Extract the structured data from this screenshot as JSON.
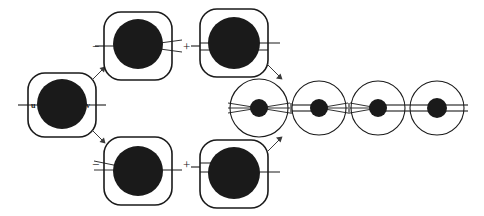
{
  "figure": {
    "type": "topological-diagram",
    "background_color": "#ffffff",
    "ink_color": "#1a1a1a",
    "arrow_color": "#3a3a3a"
  },
  "source_node": {
    "name": "source-tangle",
    "shape": "rounded-square",
    "left_label": "u",
    "right_label": "v",
    "left_connection": "single-strand",
    "right_connection": "single-strand"
  },
  "operators": {
    "minus": "−",
    "plus": "+"
  },
  "top_expansion": {
    "leading_sign": "−",
    "joining_sign": "+",
    "terms": [
      {
        "name": "top-term-1",
        "shape": "rounded-square",
        "left_connection": "single-strand",
        "right_connection": "fork"
      },
      {
        "name": "top-term-2",
        "shape": "rounded-square",
        "left_connection": "double-strand",
        "right_connection": "double-strand"
      }
    ]
  },
  "bottom_expansion": {
    "leading_sign": "−",
    "joining_sign": "+",
    "terms": [
      {
        "name": "bottom-term-1",
        "shape": "rounded-square",
        "left_connection": "fork",
        "right_connection": "single-strand"
      },
      {
        "name": "bottom-term-2",
        "shape": "rounded-square",
        "left_connection": "double-strand",
        "right_connection": "single-strand"
      }
    ]
  },
  "circle_chain": {
    "name": "reduced-circle-chain",
    "count": 4,
    "items": [
      {
        "name": "chain-circle-1",
        "left_connection": "fork",
        "right_connection": "fork"
      },
      {
        "name": "chain-circle-2",
        "left_connection": "double-strand",
        "right_connection": "fork"
      },
      {
        "name": "chain-circle-3",
        "left_connection": "fork",
        "right_connection": "double-strand"
      },
      {
        "name": "chain-circle-4",
        "left_connection": "double-strand",
        "right_connection": "double-strand"
      }
    ]
  },
  "arrows": [
    {
      "name": "arrow-source-to-top",
      "direction": "up-right"
    },
    {
      "name": "arrow-source-to-bottom",
      "direction": "down-right"
    },
    {
      "name": "arrow-top-to-chain",
      "direction": "down-right"
    },
    {
      "name": "arrow-bottom-to-chain",
      "direction": "up-right"
    }
  ]
}
